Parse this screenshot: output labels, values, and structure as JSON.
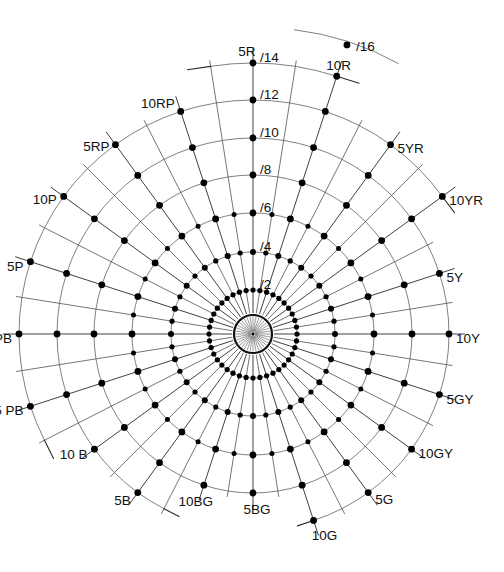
{
  "figure": {
    "background_color": "#ffffff",
    "ink_color": "#000000",
    "center": {
      "x": 253,
      "y": 334
    },
    "hub_radius": 19,
    "hub_ray_count": 36
  },
  "chart_data": {
    "type": "scatter",
    "xlabel": "",
    "ylabel": "",
    "coordinate_system": "polar",
    "grid": true,
    "legend": false,
    "hue_count": 40,
    "radial_label_angle_deg": 90,
    "hue_labels": [
      {
        "label": "5R",
        "index": 0,
        "angle_deg": 90,
        "anchor": "middle",
        "dx": -6,
        "dy": -11
      },
      {
        "label": "10R",
        "index": 2,
        "angle_deg": 72,
        "anchor": "middle",
        "dx": 2,
        "dy": -10
      },
      {
        "label": "5YR",
        "index": 4,
        "angle_deg": 54,
        "anchor": "start",
        "dx": 7,
        "dy": 4
      },
      {
        "label": "10YR",
        "index": 6,
        "angle_deg": 36,
        "anchor": "start",
        "dx": 7,
        "dy": 5
      },
      {
        "label": "5Y",
        "index": 8,
        "angle_deg": 18,
        "anchor": "start",
        "dx": 7,
        "dy": 5
      },
      {
        "label": "10Y",
        "index": 10,
        "angle_deg": 0,
        "anchor": "start",
        "dx": 7,
        "dy": 5
      },
      {
        "label": "5GY",
        "index": 12,
        "angle_deg": -18,
        "anchor": "start",
        "dx": 7,
        "dy": 5
      },
      {
        "label": "10GY",
        "index": 14,
        "angle_deg": -36,
        "anchor": "start",
        "dx": 7,
        "dy": 5
      },
      {
        "label": "5G",
        "index": 16,
        "angle_deg": -54,
        "anchor": "start",
        "dx": 7,
        "dy": 7
      },
      {
        "label": "10G",
        "index": 18,
        "angle_deg": -72,
        "anchor": "middle",
        "dx": 11,
        "dy": 16
      },
      {
        "label": "5BG",
        "index": 20,
        "angle_deg": -90,
        "anchor": "middle",
        "dx": 4,
        "dy": 17
      },
      {
        "label": "10BG",
        "index": 22,
        "angle_deg": -108,
        "anchor": "middle",
        "dx": -8,
        "dy": 17
      },
      {
        "label": "5B",
        "index": 24,
        "angle_deg": -126,
        "anchor": "end",
        "dx": -7,
        "dy": 8
      },
      {
        "label": "10 B",
        "index": 26,
        "angle_deg": -144,
        "anchor": "end",
        "dx": -7,
        "dy": 6
      },
      {
        "label": "5 PB",
        "index": 28,
        "angle_deg": -162,
        "anchor": "end",
        "dx": -7,
        "dy": 5
      },
      {
        "label": "10 PB",
        "index": 30,
        "angle_deg": 180,
        "anchor": "end",
        "dx": -7,
        "dy": 5
      },
      {
        "label": "5P",
        "index": 32,
        "angle_deg": 162,
        "anchor": "end",
        "dx": -7,
        "dy": 5
      },
      {
        "label": "10P",
        "index": 34,
        "angle_deg": 144,
        "anchor": "end",
        "dx": -7,
        "dy": 4
      },
      {
        "label": "5RP",
        "index": 36,
        "angle_deg": 126,
        "anchor": "end",
        "dx": -6,
        "dy": 2
      },
      {
        "label": "10RP",
        "index": 38,
        "angle_deg": 108,
        "anchor": "end",
        "dx": -6,
        "dy": -7
      }
    ],
    "chroma_rings": [
      {
        "label": "/2",
        "value": 2,
        "radius": 44,
        "dot_density": "full",
        "major_dot_r": 2.6,
        "minor_dot_r": 2.6,
        "label_dx": 7,
        "label_dy": -6
      },
      {
        "label": "/4",
        "value": 4,
        "radius": 82,
        "dot_density": "full",
        "major_dot_r": 3.0,
        "minor_dot_r": 2.6,
        "label_dx": 7,
        "label_dy": -6
      },
      {
        "label": "/6",
        "value": 6,
        "radius": 121,
        "dot_density": "half",
        "major_dot_r": 3.4,
        "minor_dot_r": 2.5,
        "label_dx": 7,
        "label_dy": -6
      },
      {
        "label": "/8",
        "value": 8,
        "radius": 159,
        "dot_density": "half",
        "major_dot_r": 3.4,
        "minor_dot_r": 2.5,
        "label_dx": 7,
        "label_dy": -6
      },
      {
        "label": "/10",
        "value": 10,
        "radius": 196,
        "dot_density": "half",
        "major_dot_r": 3.4,
        "minor_dot_r": 2.5,
        "label_dx": 7,
        "label_dy": -6
      },
      {
        "label": "/12",
        "value": 12,
        "radius": 234,
        "dot_density": "half",
        "major_dot_r": 3.4,
        "minor_dot_r": 2.5,
        "label_dx": 7,
        "label_dy": -6
      },
      {
        "label": "/14",
        "value": 14,
        "radius": 271,
        "dot_density": "half",
        "major_dot_r": 3.4,
        "minor_dot_r": 2.5,
        "label_dx": 7,
        "label_dy": -6
      }
    ],
    "extra_points": [
      {
        "label": "/16",
        "value": 16,
        "radius": 304,
        "hue_index": 2,
        "angle_deg": 72,
        "dot_r": 3.4,
        "label_dx": 9,
        "label_dy": 1
      }
    ]
  }
}
